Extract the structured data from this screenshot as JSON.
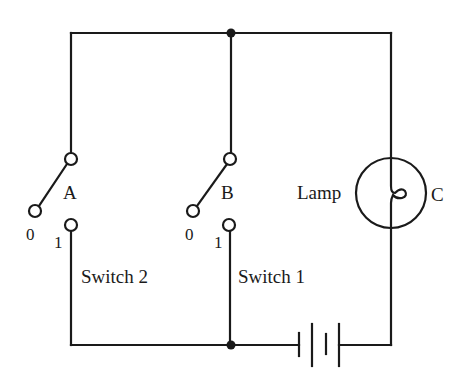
{
  "diagram": {
    "type": "circuit",
    "colors": {
      "line": "#1a1a1a",
      "background": "#ffffff"
    },
    "switches": [
      {
        "id": "A",
        "name": "Switch 2",
        "terminal_labels": {
          "off": "0",
          "on": "1"
        },
        "state": "0"
      },
      {
        "id": "B",
        "name": "Switch 1",
        "terminal_labels": {
          "off": "0",
          "on": "1"
        },
        "state": "0"
      }
    ],
    "lamp": {
      "label": "Lamp",
      "id": "C"
    },
    "battery": {
      "cells": 2
    },
    "junctions": 2
  },
  "labels": {
    "switch_a_id": "A",
    "switch_a_zero": "0",
    "switch_a_one": "1",
    "switch_a_name": "Switch 2",
    "switch_b_id": "B",
    "switch_b_zero": "0",
    "switch_b_one": "1",
    "switch_b_name": "Switch 1",
    "lamp_name": "Lamp",
    "lamp_id": "C"
  }
}
